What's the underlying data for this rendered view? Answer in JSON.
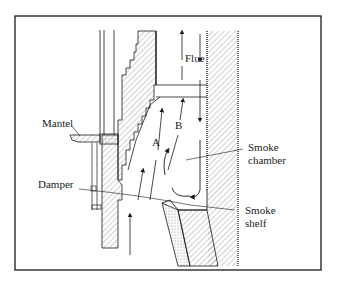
{
  "labels": {
    "flue": "Flue",
    "mantel": "Mantel",
    "damper": "Damper",
    "smoke_chamber_1": "Smoke",
    "smoke_chamber_2": "chamber",
    "smoke_shelf_1": "Smoke",
    "smoke_shelf_2": "shelf",
    "path_a": "A",
    "path_b": "B"
  },
  "colors": {
    "ink": "#1a1a1a",
    "hatch": "#8a8a8a",
    "background": "#ffffff"
  }
}
